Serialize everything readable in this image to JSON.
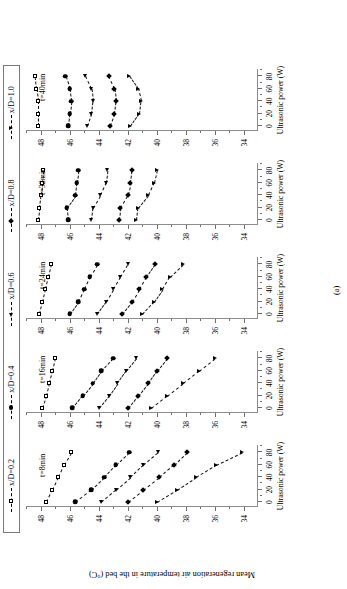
{
  "figure": {
    "subcaption": "(a)",
    "ylabel": "Mean regeneration air temperature in the bed (°C)",
    "xlabel": "Ultrasonic power (W)"
  },
  "legend": {
    "items": [
      {
        "label": "x/D=0.2",
        "marker": "open-square-marker"
      },
      {
        "label": "x/D=0.4",
        "marker": "filled-circle-marker"
      },
      {
        "label": "x/D=0.6",
        "marker": "filled-left-triangle-marker"
      },
      {
        "label": "x/D=0.8",
        "marker": "filled-diamond-marker"
      },
      {
        "label": "x/D=1.0",
        "marker": "filled-down-triangle-marker"
      }
    ]
  },
  "panels": [
    {
      "tag": "t=8min",
      "xlabel": "Ultrasonic power (W)"
    },
    {
      "tag": "t=16min",
      "xlabel": "Ultrasonic power (W)"
    },
    {
      "tag": "t=24min",
      "xlabel": "Ultrasonic power (W)"
    },
    {
      "tag": "t=32min",
      "xlabel": "Ultrasonic power (W)"
    },
    {
      "tag": "t=40min",
      "xlabel": "Ultrasonic power (W)"
    }
  ],
  "chart_data": {
    "type": "line",
    "title": "",
    "xlabel": "Ultrasonic power (W)",
    "ylabel": "Mean regeneration air temperature in the bed (°C)",
    "x": [
      0,
      20,
      40,
      60,
      80
    ],
    "xlim": [
      -8,
      92
    ],
    "ylim": [
      33,
      49
    ],
    "yticks": [
      34,
      36,
      38,
      40,
      42,
      44,
      46,
      48
    ],
    "xticks": [
      0,
      20,
      40,
      60,
      80
    ],
    "grid": false,
    "legend_position": "top",
    "panels": [
      {
        "label": "t=8min",
        "series": [
          {
            "name": "x/D=0.2",
            "marker": "open-square-marker",
            "values": [
              47.6,
              47.2,
              46.8,
              46.4,
              45.9
            ]
          },
          {
            "name": "x/D=0.4",
            "marker": "filled-circle-marker",
            "values": [
              45.6,
              44.5,
              43.6,
              42.8,
              41.9
            ]
          },
          {
            "name": "x/D=0.6",
            "marker": "filled-left-triangle-marker",
            "values": [
              43.8,
              42.8,
              41.8,
              40.9,
              39.9
            ]
          },
          {
            "name": "x/D=0.8",
            "marker": "filled-diamond-marker",
            "values": [
              42.0,
              40.9,
              39.8,
              38.8,
              37.9
            ]
          },
          {
            "name": "x/D=1.0",
            "marker": "filled-down-triangle-marker",
            "values": [
              40.0,
              38.6,
              37.3,
              35.9,
              34.1
            ]
          }
        ]
      },
      {
        "label": "t=16min",
        "series": [
          {
            "name": "x/D=0.2",
            "marker": "open-square-marker",
            "values": [
              47.9,
              47.6,
              47.4,
              47.2,
              47.0
            ]
          },
          {
            "name": "x/D=0.4",
            "marker": "filled-circle-marker",
            "values": [
              45.8,
              45.1,
              44.4,
              43.8,
              43.0
            ]
          },
          {
            "name": "x/D=0.6",
            "marker": "filled-left-triangle-marker",
            "values": [
              44.0,
              43.3,
              42.7,
              42.1,
              41.4
            ]
          },
          {
            "name": "x/D=0.8",
            "marker": "filled-diamond-marker",
            "values": [
              42.0,
              41.3,
              40.6,
              40.0,
              39.3
            ]
          },
          {
            "name": "x/D=1.0",
            "marker": "filled-down-triangle-marker",
            "values": [
              40.4,
              39.3,
              38.2,
              37.1,
              36.0
            ]
          }
        ]
      },
      {
        "label": "t=24min",
        "series": [
          {
            "name": "x/D=0.2",
            "marker": "open-square-marker",
            "values": [
              48.1,
              47.9,
              47.7,
              47.5,
              47.3
            ]
          },
          {
            "name": "x/D=0.4",
            "marker": "filled-circle-marker",
            "values": [
              46.0,
              45.4,
              45.0,
              44.6,
              44.1
            ]
          },
          {
            "name": "x/D=0.6",
            "marker": "filled-left-triangle-marker",
            "values": [
              44.1,
              43.5,
              43.0,
              42.5,
              42.0
            ]
          },
          {
            "name": "x/D=0.8",
            "marker": "filled-diamond-marker",
            "values": [
              42.4,
              41.7,
              41.2,
              40.7,
              40.1
            ]
          },
          {
            "name": "x/D=1.0",
            "marker": "filled-down-triangle-marker",
            "values": [
              41.0,
              40.2,
              39.6,
              39.1,
              38.2
            ]
          }
        ]
      },
      {
        "label": "t=32min",
        "series": [
          {
            "name": "x/D=0.2",
            "marker": "open-square-marker",
            "values": [
              48.2,
              48.1,
              48.0,
              47.9,
              47.8
            ]
          },
          {
            "name": "x/D=0.4",
            "marker": "filled-circle-marker",
            "values": [
              46.1,
              46.2,
              45.6,
              45.5,
              45.4
            ]
          },
          {
            "name": "x/D=0.6",
            "marker": "filled-left-triangle-marker",
            "values": [
              44.5,
              44.4,
              43.9,
              43.5,
              43.4
            ]
          },
          {
            "name": "x/D=0.8",
            "marker": "filled-diamond-marker",
            "values": [
              42.6,
              42.5,
              42.0,
              41.8,
              41.7
            ]
          },
          {
            "name": "x/D=1.0",
            "marker": "filled-down-triangle-marker",
            "values": [
              41.4,
              41.3,
              40.6,
              40.2,
              40.0
            ]
          }
        ]
      },
      {
        "label": "t=40min",
        "series": [
          {
            "name": "x/D=0.2",
            "marker": "open-square-marker",
            "values": [
              48.2,
              48.2,
              48.2,
              48.3,
              48.4
            ]
          },
          {
            "name": "x/D=0.4",
            "marker": "filled-circle-marker",
            "values": [
              46.1,
              46.0,
              45.9,
              46.0,
              46.3
            ]
          },
          {
            "name": "x/D=0.6",
            "marker": "filled-left-triangle-marker",
            "values": [
              44.8,
              44.5,
              44.4,
              44.5,
              44.9
            ]
          },
          {
            "name": "x/D=0.8",
            "marker": "filled-diamond-marker",
            "values": [
              43.2,
              42.9,
              42.8,
              42.9,
              43.3
            ]
          },
          {
            "name": "x/D=1.0",
            "marker": "filled-down-triangle-marker",
            "values": [
              41.8,
              41.2,
              41.1,
              41.3,
              41.9
            ]
          }
        ]
      }
    ]
  }
}
